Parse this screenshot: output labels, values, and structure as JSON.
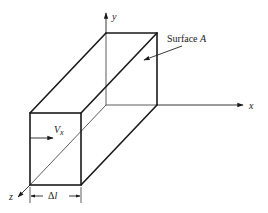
{
  "diagram": {
    "axes": {
      "x_label": "x",
      "y_label": "y",
      "z_label": "z"
    },
    "labels": {
      "surface": "Surface ",
      "surface_var": "A",
      "velocity": "V",
      "velocity_sub": "x",
      "length_delta": "Δ",
      "length_var": "l"
    },
    "colors": {
      "line": "#1a1a1a",
      "background": "#ffffff"
    }
  }
}
